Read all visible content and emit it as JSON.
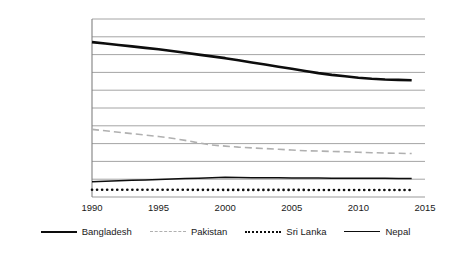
{
  "chart_data": {
    "type": "line",
    "title": "",
    "subtitle": "",
    "xlabel": "",
    "ylabel": "",
    "grid": true,
    "legend_position": "bottom",
    "xlim": [
      1990,
      2015
    ],
    "ylim": [
      0,
      5000000
    ],
    "ytick_labels": [
      "5,000,000",
      "4,500,000",
      "4,000,000",
      "3,500,000",
      "3,000,000",
      "2,500,000",
      "2,000,000",
      "1,500,000",
      "1,000,000",
      "500,000",
      "0"
    ],
    "ytick_values": [
      5000000,
      4500000,
      4000000,
      3500000,
      3000000,
      2500000,
      2000000,
      1500000,
      1000000,
      500000,
      0
    ],
    "xtick_labels": [
      "1990",
      "1995",
      "2000",
      "2005",
      "2010",
      "2015"
    ],
    "xtick_values": [
      1990,
      1995,
      2000,
      2005,
      2010,
      2015
    ],
    "x": [
      1990,
      1991,
      1992,
      1993,
      1994,
      1995,
      1996,
      1997,
      1998,
      1999,
      2000,
      2001,
      2002,
      2003,
      2004,
      2005,
      2006,
      2007,
      2008,
      2009,
      2010,
      2011,
      2012,
      2013,
      2014
    ],
    "series": [
      {
        "name": "Bangladesh",
        "color": "#0d0d0d",
        "style": "solid",
        "width": 2.6,
        "values": [
          4350000,
          4310000,
          4270000,
          4230000,
          4190000,
          4150000,
          4100000,
          4050000,
          4000000,
          3950000,
          3900000,
          3840000,
          3780000,
          3720000,
          3660000,
          3600000,
          3540000,
          3480000,
          3430000,
          3390000,
          3350000,
          3320000,
          3300000,
          3290000,
          3280000
        ]
      },
      {
        "name": "Pakistan",
        "color": "#b0b0b0",
        "style": "dashed",
        "width": 1.6,
        "values": [
          1900000,
          1860000,
          1820000,
          1780000,
          1740000,
          1700000,
          1650000,
          1590000,
          1520000,
          1460000,
          1430000,
          1400000,
          1380000,
          1360000,
          1340000,
          1320000,
          1300000,
          1290000,
          1280000,
          1270000,
          1255000,
          1245000,
          1235000,
          1228000,
          1220000
        ]
      },
      {
        "name": "Sri Lanka",
        "color": "#0d0d0d",
        "style": "dotted",
        "width": 2.6,
        "values": [
          205000,
          205000,
          204000,
          204000,
          203000,
          203000,
          202000,
          202000,
          201000,
          201000,
          200000,
          200000,
          200000,
          200000,
          199000,
          199000,
          199000,
          198000,
          198000,
          198000,
          197000,
          197000,
          197000,
          196000,
          196000
        ]
      },
      {
        "name": "Nepal",
        "color": "#0d0d0d",
        "style": "solid",
        "width": 1.5,
        "values": [
          430000,
          442000,
          455000,
          468000,
          480000,
          492000,
          505000,
          518000,
          530000,
          542000,
          552000,
          548000,
          543000,
          540000,
          538000,
          536000,
          534000,
          532000,
          530000,
          528000,
          527000,
          525000,
          524000,
          523000,
          522000
        ]
      }
    ]
  },
  "legend": {
    "items": [
      {
        "label": "Bangladesh",
        "swatch": "solid-thick-black"
      },
      {
        "label": "Pakistan",
        "swatch": "dashed-gray"
      },
      {
        "label": "Sri Lanka",
        "swatch": "dotted-black"
      },
      {
        "label": "Nepal",
        "swatch": "solid-thin-black"
      }
    ]
  },
  "colors": {
    "bangladesh": "#0d0d0d",
    "pakistan": "#b0b0b0",
    "srilanka": "#0d0d0d",
    "nepal": "#0d0d0d",
    "gridline": "#9a9a9a",
    "axis": "#808080",
    "text": "#1a1a1a",
    "background": "#ffffff"
  }
}
